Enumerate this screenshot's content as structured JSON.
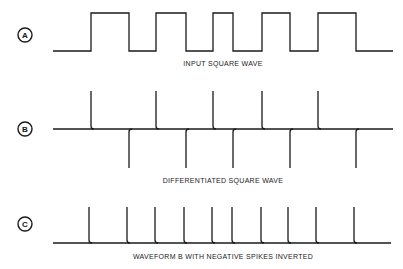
{
  "panels": [
    {
      "id": "A",
      "caption": "INPUT SQUARE WAVE"
    },
    {
      "id": "B",
      "caption": "DIFFERENTIATED SQUARE WAVE"
    },
    {
      "id": "C",
      "caption": "WAVEFORM B WITH NEGATIVE SPIKES INVERTED"
    }
  ],
  "colors": {
    "stroke": "#1a1a1a",
    "background": "#ffffff"
  }
}
